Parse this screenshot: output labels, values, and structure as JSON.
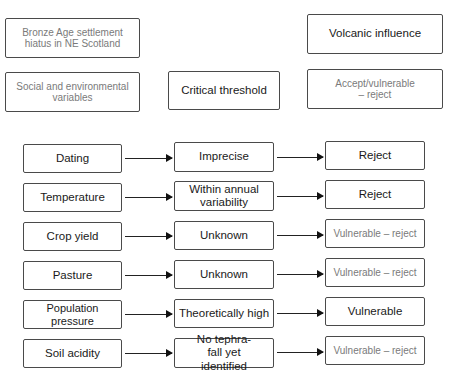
{
  "header": {
    "hiatus": "Bronze Age settlement hiatus in NE Scotland",
    "variables": "Social and environmental variables",
    "threshold": "Critical threshold",
    "volcanic": "Volcanic influence",
    "accept": "Accept/vulnerable – reject"
  },
  "rows": [
    {
      "variable": "Dating",
      "threshold": "Imprecise",
      "result": "Reject",
      "result_style": "dark"
    },
    {
      "variable": "Temperature",
      "threshold": "Within annual variability",
      "result": "Reject",
      "result_style": "dark"
    },
    {
      "variable": "Crop yield",
      "threshold": "Unknown",
      "result": "Vulnerable – reject",
      "result_style": "light"
    },
    {
      "variable": "Pasture",
      "threshold": "Unknown",
      "result": "Vulnerable – reject",
      "result_style": "light"
    },
    {
      "variable": "Population pressure",
      "threshold": "Theoretically high",
      "result": "Vulnerable",
      "result_style": "dark"
    },
    {
      "variable": "Soil acidity",
      "threshold": "No tephra-fall yet identified",
      "result": "Vulnerable – reject",
      "result_style": "light"
    }
  ],
  "colors": {
    "border": "#4a4a4a",
    "text_dark": "#1a1a1a",
    "text_light": "#7a7a7a"
  }
}
